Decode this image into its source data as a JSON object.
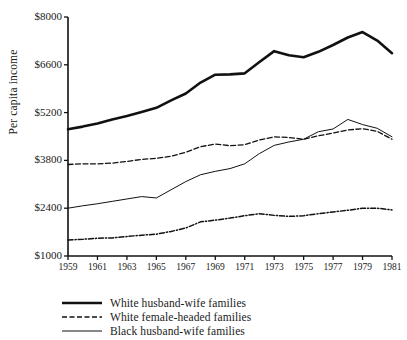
{
  "chart_data": {
    "type": "line",
    "title": "",
    "xlabel": "",
    "ylabel": "Per capita income",
    "xlim": [
      1959,
      1981
    ],
    "ylim": [
      1000,
      8000
    ],
    "grid": false,
    "legend_position": "bottom-left",
    "x": [
      1959,
      1960,
      1961,
      1962,
      1963,
      1964,
      1965,
      1966,
      1967,
      1968,
      1969,
      1970,
      1971,
      1972,
      1973,
      1974,
      1975,
      1976,
      1977,
      1978,
      1979,
      1980,
      1981
    ],
    "xticks": [
      "1959",
      "1961",
      "1963",
      "1965",
      "1967",
      "1969",
      "1971",
      "1973",
      "1975",
      "1977",
      "1979",
      "1981"
    ],
    "yticks": [
      "$1000",
      "$2400",
      "$3800",
      "$5200",
      "$6600",
      "$8000"
    ],
    "ytick_values": [
      1000,
      2400,
      3800,
      5200,
      6600,
      8000
    ],
    "series": [
      {
        "name": "White husband-wife families",
        "style": "solid-thick",
        "color": "#111111",
        "values": [
          4710,
          4790,
          4880,
          5000,
          5100,
          5220,
          5340,
          5560,
          5760,
          6080,
          6310,
          6320,
          6350,
          6680,
          7000,
          6880,
          6820,
          6980,
          7180,
          7400,
          7560,
          7310,
          6940
        ]
      },
      {
        "name": "White female-headed families",
        "style": "dashed",
        "color": "#111111",
        "values": [
          3680,
          3700,
          3700,
          3720,
          3770,
          3830,
          3860,
          3920,
          4040,
          4200,
          4280,
          4230,
          4260,
          4400,
          4490,
          4470,
          4420,
          4520,
          4600,
          4690,
          4730,
          4650,
          4420
        ]
      },
      {
        "name": "Black husband-wife families",
        "style": "solid-thin",
        "color": "#111111",
        "values": [
          2400,
          2470,
          2530,
          2600,
          2670,
          2740,
          2700,
          2940,
          3180,
          3380,
          3480,
          3560,
          3700,
          4000,
          4240,
          4340,
          4420,
          4640,
          4720,
          5000,
          4850,
          4740,
          4490
        ]
      },
      {
        "name": "Black female-headed families",
        "style": "dash-dot",
        "color": "#111111",
        "values": [
          1470,
          1490,
          1520,
          1530,
          1570,
          1610,
          1640,
          1720,
          1820,
          2000,
          2050,
          2110,
          2180,
          2240,
          2190,
          2160,
          2180,
          2240,
          2290,
          2340,
          2400,
          2400,
          2350
        ]
      }
    ]
  },
  "legend": {
    "entries": [
      {
        "label": "White husband-wife families",
        "style": "solid-thick"
      },
      {
        "label": "White female-headed families",
        "style": "dashed"
      },
      {
        "label": "Black husband-wife families",
        "style": "solid-thin"
      }
    ]
  },
  "axes": {
    "y_title": "Per capita income"
  }
}
